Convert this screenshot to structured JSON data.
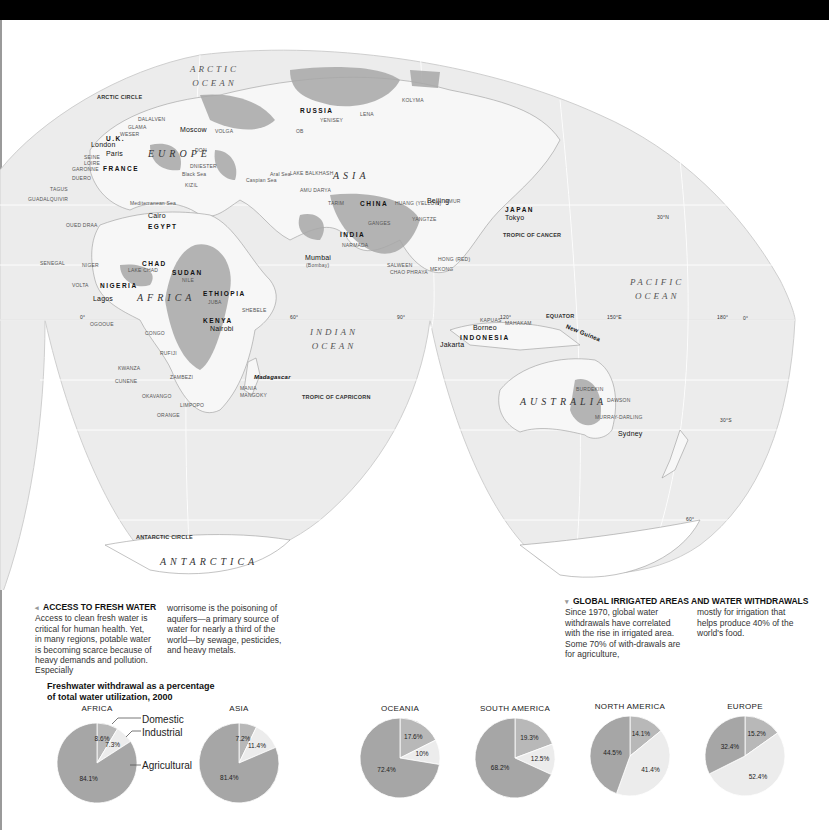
{
  "map": {
    "oceans": {
      "arctic": "ARCTIC OCEAN",
      "indian_1": "INDIAN",
      "indian_2": "OCEAN",
      "pacific_1": "PACIFIC",
      "pacific_2": "OCEAN",
      "arctic_1": "ARCTIC",
      "arctic_2": "OCEAN"
    },
    "continents": {
      "europe": "EUROPE",
      "asia": "ASIA",
      "africa": "AFRICA",
      "australia": "AUSTRALIA",
      "antarctica": "ANTARCTICA"
    },
    "countries": {
      "russia": "RUSSIA",
      "china": "CHINA",
      "india": "INDIA",
      "japan": "JAPAN",
      "uk": "U.K.",
      "france": "FRANCE",
      "egypt": "EGYPT",
      "chad": "CHAD",
      "sudan": "SUDAN",
      "nigeria": "NIGERIA",
      "ethiopia": "ETHIOPIA",
      "kenya": "KENYA",
      "indonesia": "INDONESIA"
    },
    "cities": {
      "london": "London",
      "paris": "Paris",
      "moscow": "Moscow",
      "cairo": "Cairo",
      "beijing": "Beijing",
      "tokyo": "Tokyo",
      "mumbai": "Mumbai",
      "mumbai_alt": "(Bombay)",
      "lagos": "Lagos",
      "nairobi": "Nairobi",
      "jakarta": "Jakarta",
      "sydney": "Sydney"
    },
    "islands": {
      "madagascar": "Madagascar",
      "borneo": "Borneo",
      "new_guinea": "New Guinea"
    },
    "rivers": {
      "seine": "SEINE",
      "loire": "LOIRE",
      "garonne": "GARONNE",
      "duero": "DUERO",
      "tagus": "TAGUS",
      "guadalquivir": "GUADALQUIVIR",
      "weser": "WESER",
      "glama": "GLAMA",
      "dalalven": "DALALVEN",
      "volga": "VOLGA",
      "don": "DON",
      "dniester": "DNIESTER",
      "kizil": "KIZIL",
      "ob": "OB",
      "yenisey": "YENISEY",
      "lena": "LENA",
      "kolyma": "KOLYMA",
      "amur": "AMUR",
      "tarim": "TARIM",
      "huang": "HUANG (YELLOW)",
      "yangtze": "YANGTZE",
      "xi": "XI (PEARL)",
      "hong": "HONG (RED)",
      "mekong": "MEKONG",
      "salween": "SALWEEN",
      "chao_phraya": "CHAO PHRAYA",
      "ganges": "GANGES",
      "narmada": "NARMADA",
      "indus": "INDUS",
      "oued_draa": "OUED DRAA",
      "senegal": "SENEGAL",
      "niger": "NIGER",
      "volta": "VOLTA",
      "nile": "NILE",
      "ogooue": "OGOOUE",
      "congo": "CONGO",
      "kwanza": "KWANZA",
      "cunene": "CUNENE",
      "zambezi": "ZAMBEZI",
      "okavango": "OKAVANGO",
      "limpopo": "LIMPOPO",
      "orange": "ORANGE",
      "juba": "JUBA",
      "shebele": "SHEBELE",
      "rufiji": "RUFIJI",
      "mania": "MANIA",
      "mangoky": "MANGOKY",
      "kapuas": "KAPUAS",
      "mahakam": "MAHAKAM",
      "burdekin": "BURDEKIN",
      "dawson": "DAWSON",
      "murray_darling": "MURRAY-DARLING",
      "lake_chad": "LAKE CHAD",
      "lake_balkhash": "LAKE BALKHASH",
      "aral": "Aral Sea",
      "black_sea": "Black Sea",
      "caspian": "Caspian Sea",
      "mediterranean": "Mediterranean Sea",
      "amu_darya": "AMU DARYA",
      "syr_darya": "SYR DARYA",
      "tigris": "TIGRIS",
      "euphrates": "EUPHRATES",
      "kura": "KUR",
      "araks": "ARAS"
    },
    "lines": {
      "arctic_circle": "ARCTIC CIRCLE",
      "tropic_cancer": "TROPIC OF CANCER",
      "equator": "EQUATOR",
      "tropic_capricorn": "TROPIC OF CAPRICORN",
      "antarctic_circle": "ANTARCTIC CIRCLE"
    },
    "degrees": {
      "d0_left": "0°",
      "d60": "60°",
      "d90": "90°",
      "d120": "120°",
      "d150e": "150°E",
      "d180": "180°",
      "d0_right": "0°",
      "n30": "30°N",
      "s30": "30°S",
      "s60": "60°",
      "n60": "60°"
    }
  },
  "captions": {
    "access": {
      "heading": "ACCESS TO FRESH WATER",
      "col1": "Access to clean fresh water is critical for human health. Yet, in many regions, potable water is becoming scarce because of heavy demands and pollution. Especially",
      "col2": "worrisome is the poisoning of aquifers—a primary source of water for nearly a third of the world—by sewage, pesticides, and heavy metals."
    },
    "irrigated": {
      "heading": "GLOBAL IRRIGATED AREAS AND WATER WITHDRAWALS",
      "col1": "Since 1970, global water withdrawals have correlated with the rise in irrigated area. Some 70% of with-drawals are for agriculture,",
      "col2": "mostly for irrigation that helps produce 40% of the world's food."
    }
  },
  "chart_data": {
    "type": "pie",
    "title": "Freshwater withdrawal as a percentage of total water utilization, 2000",
    "title_line1": "Freshwater withdrawal as a percentage",
    "title_line2": "of total water utilization, 2000",
    "legend": [
      "Domestic",
      "Industrial",
      "Agricultural"
    ],
    "colors": {
      "Domestic": "#b8b8b8",
      "Industrial": "#ececec",
      "Agricultural": "#a6a6a6"
    },
    "regions": [
      {
        "name": "AFRICA",
        "domestic": 8.6,
        "industrial": 7.3,
        "agricultural": 84.1,
        "labels": {
          "domestic": "8.6%",
          "industrial": "7.3%",
          "agricultural": "84.1%"
        }
      },
      {
        "name": "ASIA",
        "domestic": 7.2,
        "industrial": 11.4,
        "agricultural": 81.4,
        "labels": {
          "domestic": "7.2%",
          "industrial": "11.4%",
          "agricultural": "81.4%"
        }
      },
      {
        "name": "OCEANIA",
        "domestic": 17.6,
        "industrial": 10,
        "agricultural": 72.4,
        "labels": {
          "domestic": "17.6%",
          "industrial": "10%",
          "agricultural": "72.4%"
        }
      },
      {
        "name": "SOUTH AMERICA",
        "domestic": 19.3,
        "industrial": 12.5,
        "agricultural": 68.2,
        "labels": {
          "domestic": "19.3%",
          "industrial": "12.5%",
          "agricultural": "68.2%"
        }
      },
      {
        "name": "NORTH AMERICA",
        "domestic": 14.1,
        "industrial": 41.4,
        "agricultural": 44.5,
        "labels": {
          "domestic": "14.1%",
          "industrial": "41.4%",
          "agricultural": "44.5%"
        }
      },
      {
        "name": "EUROPE",
        "domestic": 15.2,
        "industrial": 52.4,
        "agricultural": 32.4,
        "labels": {
          "domestic": "15.2%",
          "industrial": "52.4%",
          "agricultural": "32.4%"
        }
      }
    ]
  }
}
